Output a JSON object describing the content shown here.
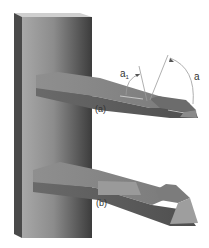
{
  "figure": {
    "labels": {
      "tool_a": "(a)",
      "tool_b": "(b)",
      "angle_a1_main": "a",
      "angle_a1_sub": "1",
      "angle_a": "a"
    },
    "colors": {
      "background": "#ffffff",
      "post_light": "#9a9a9a",
      "post_dark": "#3a3a3a",
      "post_edge": "#4a4a4a",
      "tool_top": "#8a8a8a",
      "tool_side": "#5e5e5e",
      "tool_face": "#9c9c9c",
      "annotation_line": "#9a9a9a",
      "text": "#333333"
    }
  }
}
